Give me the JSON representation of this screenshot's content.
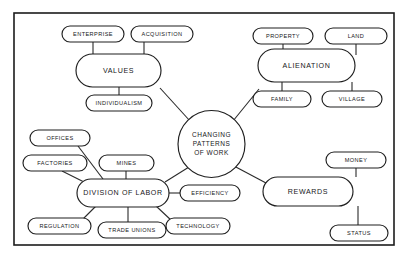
{
  "diagram": {
    "type": "concept-map",
    "frame": {
      "x": 14,
      "y": 13,
      "width": 380,
      "height": 232
    },
    "colors": {
      "background": "#ffffff",
      "stroke": "#1f1f1f",
      "text": "#17171a",
      "frame": "#1c1c1c"
    },
    "center": {
      "id": "center",
      "label": "CHANGING PATTERNS OF WORK",
      "lines": [
        "CHANGING",
        "PATTERNS",
        "OF WORK"
      ],
      "shape": "circle",
      "cx": 211.5,
      "cy": 144,
      "r": 33.5
    },
    "hubs": [
      {
        "id": "values",
        "label": "VALUES",
        "shape": "rounded-rect",
        "x": 76,
        "y": 54,
        "width": 85,
        "height": 33
      },
      {
        "id": "alienation",
        "label": "ALIENATION",
        "shape": "rounded-rect",
        "x": 258,
        "y": 49,
        "width": 97,
        "height": 33
      },
      {
        "id": "division-of-labor",
        "label": "DIVISION OF LABOR",
        "shape": "rounded-rect",
        "x": 77,
        "y": 179,
        "width": 92,
        "height": 28
      },
      {
        "id": "rewards",
        "label": "REWARDS",
        "shape": "rounded-rect",
        "x": 263,
        "y": 177,
        "width": 90,
        "height": 29
      }
    ],
    "leaves": [
      {
        "id": "enterprise",
        "label": "ENTERPRISE",
        "x": 62,
        "y": 26,
        "width": 62,
        "height": 16
      },
      {
        "id": "acquisition",
        "label": "ACQUISITION",
        "x": 131,
        "y": 26,
        "width": 62,
        "height": 16
      },
      {
        "id": "individualism",
        "label": "INDIVIDUALISM",
        "x": 86,
        "y": 95,
        "width": 66,
        "height": 16
      },
      {
        "id": "property",
        "label": "PROPERTY",
        "x": 253,
        "y": 28,
        "width": 60,
        "height": 16
      },
      {
        "id": "land",
        "label": "LAND",
        "x": 325,
        "y": 28,
        "width": 62,
        "height": 16
      },
      {
        "id": "family",
        "label": "FAMILY",
        "x": 253,
        "y": 91,
        "width": 58,
        "height": 16
      },
      {
        "id": "village",
        "label": "VILLAGE",
        "x": 322,
        "y": 91,
        "width": 60,
        "height": 16
      },
      {
        "id": "offices",
        "label": "OFFICES",
        "x": 30,
        "y": 130,
        "width": 60,
        "height": 16
      },
      {
        "id": "factories",
        "label": "FACTORIES",
        "x": 23,
        "y": 155,
        "width": 64,
        "height": 16
      },
      {
        "id": "mines",
        "label": "MINES",
        "x": 99,
        "y": 155,
        "width": 55,
        "height": 16
      },
      {
        "id": "regulation",
        "label": "REGULATION",
        "x": 28,
        "y": 218,
        "width": 63,
        "height": 16
      },
      {
        "id": "trade-unions",
        "label": "TRADE UNIONS",
        "x": 98,
        "y": 222,
        "width": 68,
        "height": 16
      },
      {
        "id": "efficiency",
        "label": "EFFICIENCY",
        "x": 180,
        "y": 185,
        "width": 60,
        "height": 16
      },
      {
        "id": "technology",
        "label": "TECHNOLOGY",
        "x": 166,
        "y": 218,
        "width": 64,
        "height": 16
      },
      {
        "id": "money",
        "label": "MONEY",
        "x": 326,
        "y": 152,
        "width": 60,
        "height": 16
      },
      {
        "id": "status",
        "label": "STATUS",
        "x": 330,
        "y": 225,
        "width": 58,
        "height": 16
      }
    ],
    "edges": [
      {
        "id": "edge-center-values",
        "from": "center",
        "to": "values",
        "x1": 190,
        "y1": 121,
        "x2": 160,
        "y2": 88
      },
      {
        "id": "edge-center-alienation",
        "from": "center",
        "to": "alienation",
        "x1": 233,
        "y1": 121,
        "x2": 259,
        "y2": 89
      },
      {
        "id": "edge-center-division",
        "from": "center",
        "to": "division-of-labor",
        "x1": 189,
        "y1": 167,
        "x2": 165,
        "y2": 182
      },
      {
        "id": "edge-center-rewards",
        "from": "center",
        "to": "rewards",
        "x1": 234,
        "y1": 166,
        "x2": 266,
        "y2": 183
      },
      {
        "id": "edge-values-enterprise",
        "from": "values",
        "to": "enterprise",
        "x1": 93,
        "y1": 54,
        "x2": 93,
        "y2": 42
      },
      {
        "id": "edge-values-acquisition",
        "from": "values",
        "to": "acquisition",
        "x1": 144,
        "y1": 54,
        "x2": 144,
        "y2": 42
      },
      {
        "id": "edge-values-individualism",
        "from": "values",
        "to": "individualism",
        "x1": 119,
        "y1": 87,
        "x2": 119,
        "y2": 95
      },
      {
        "id": "edge-alien-property",
        "from": "alienation",
        "to": "property",
        "x1": 283,
        "y1": 49,
        "x2": 283,
        "y2": 44
      },
      {
        "id": "edge-alien-land",
        "from": "alienation",
        "to": "land",
        "x1": 356,
        "y1": 44,
        "x2": 356,
        "y2": 55
      },
      {
        "id": "edge-alien-family",
        "from": "alienation",
        "to": "family",
        "x1": 282,
        "y1": 82,
        "x2": 282,
        "y2": 91
      },
      {
        "id": "edge-alien-village",
        "from": "alienation",
        "to": "village",
        "x1": 352,
        "y1": 82,
        "x2": 352,
        "y2": 91
      },
      {
        "id": "edge-div-offices",
        "from": "division-of-labor",
        "to": "offices",
        "x1": 103,
        "y1": 179,
        "x2": 78,
        "y2": 146
      },
      {
        "id": "edge-div-factories",
        "from": "division-of-labor",
        "to": "factories",
        "x1": 86,
        "y1": 183,
        "x2": 62,
        "y2": 171
      },
      {
        "id": "edge-div-mines",
        "from": "division-of-labor",
        "to": "mines",
        "x1": 126,
        "y1": 179,
        "x2": 126,
        "y2": 171
      },
      {
        "id": "edge-div-regulation",
        "from": "division-of-labor",
        "to": "regulation",
        "x1": 96,
        "y1": 206,
        "x2": 80,
        "y2": 222
      },
      {
        "id": "edge-div-tradeunions",
        "from": "division-of-labor",
        "to": "trade-unions",
        "x1": 128,
        "y1": 207,
        "x2": 128,
        "y2": 222
      },
      {
        "id": "edge-div-technology",
        "from": "division-of-labor",
        "to": "technology",
        "x1": 156,
        "y1": 206,
        "x2": 172,
        "y2": 221
      },
      {
        "id": "edge-div-efficiency",
        "from": "division-of-labor",
        "to": "efficiency",
        "x1": 169,
        "y1": 193,
        "x2": 180,
        "y2": 193
      },
      {
        "id": "edge-rewards-money",
        "from": "rewards",
        "to": "money",
        "x1": 356,
        "y1": 168,
        "x2": 356,
        "y2": 177
      },
      {
        "id": "edge-rewards-status",
        "from": "rewards",
        "to": "status",
        "x1": 358,
        "y1": 206,
        "x2": 358,
        "y2": 225
      }
    ]
  }
}
